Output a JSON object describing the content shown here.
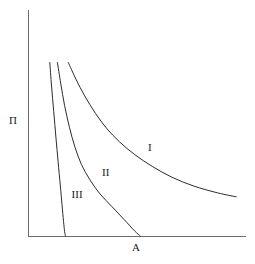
{
  "figure": {
    "background_color": "#ffffff",
    "line_color": "#2b2b2b",
    "axis_color": "#6b6b6b"
  },
  "axes": {
    "ylabel": "Π",
    "xlabel": "A",
    "ylabel_name": "pi-axis-label",
    "xlabel_name": "a-axis-label"
  },
  "labels": {
    "curve1": "I",
    "curve2": "II",
    "curve3": "III"
  },
  "chart_data": {
    "type": "line",
    "title": "",
    "subtitle": "",
    "xlabel": "A",
    "ylabel": "Π",
    "grid": false,
    "legend": "inline-annotations",
    "axis_style": "L-shaped spines, no ticks, no tick labels",
    "xlim": [
      0,
      1
    ],
    "ylim": [
      0,
      1
    ],
    "annotations": [
      {
        "text": "I",
        "x": 0.55,
        "y": 0.45
      },
      {
        "text": "II",
        "x": 0.34,
        "y": 0.32
      },
      {
        "text": "III",
        "x": 0.2,
        "y": 0.21
      }
    ],
    "series": [
      {
        "name": "I",
        "label": "I",
        "description": "Outermost decay curve; highest adsorption at given A, falls gradually and flattens toward a plateau at the right of the plot without meeting the x-axis.",
        "x": [
          0.185,
          0.22,
          0.26,
          0.31,
          0.36,
          0.42,
          0.49,
          0.57,
          0.66,
          0.76,
          0.87,
          0.955
        ],
        "y": [
          0.885,
          0.8,
          0.715,
          0.625,
          0.55,
          0.48,
          0.415,
          0.355,
          0.3,
          0.255,
          0.22,
          0.2
        ]
      },
      {
        "name": "II",
        "label": "II",
        "description": "Intermediate curve; steep near the y-axis then bends and reaches the x-axis at about A = 0.51.",
        "x": [
          0.135,
          0.15,
          0.168,
          0.19,
          0.215,
          0.245,
          0.285,
          0.33,
          0.385,
          0.44,
          0.49,
          0.515
        ],
        "y": [
          0.885,
          0.78,
          0.665,
          0.555,
          0.455,
          0.365,
          0.285,
          0.215,
          0.15,
          0.085,
          0.025,
          0.0
        ]
      },
      {
        "name": "III",
        "label": "III",
        "description": "Innermost, steepest curve; drops almost vertically and meets the x-axis at about A = 0.17.",
        "x": [
          0.1,
          0.108,
          0.118,
          0.128,
          0.138,
          0.148,
          0.156,
          0.163,
          0.168,
          0.172
        ],
        "y": [
          0.885,
          0.765,
          0.635,
          0.505,
          0.38,
          0.26,
          0.16,
          0.075,
          0.022,
          0.0
        ]
      }
    ]
  }
}
